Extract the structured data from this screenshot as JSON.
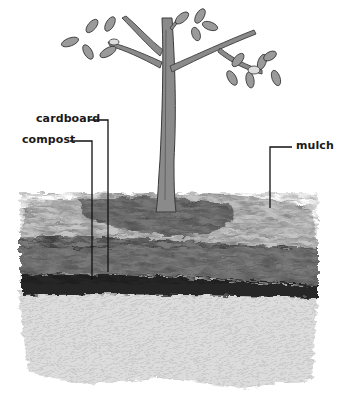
{
  "diagram": {
    "labels": {
      "cardboard": "cardboard",
      "compost": "compost",
      "mulch": "mulch"
    },
    "layers_top_to_bottom": [
      "mulch",
      "compost",
      "cardboard",
      "soil"
    ],
    "colors": {
      "ink": "#1a1a1a",
      "mulch": "#b9b9b9",
      "compost": "#6e6e6e",
      "cardboard": "#2b2b2b",
      "soil": "#d9d9d9",
      "trunk": "#7a7a7a",
      "leaf": "#8c8c8c"
    }
  }
}
